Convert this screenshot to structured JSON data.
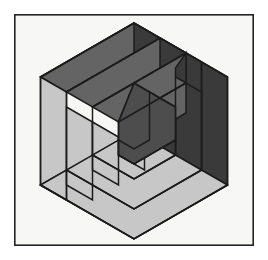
{
  "artwork": {
    "title": "Hexagonal Spiral Op-Art Figure",
    "type": "geometric-illustration",
    "canvas": {
      "width": 268,
      "height": 260,
      "background": "#ffffff"
    },
    "frame": {
      "x": 14,
      "y": 14,
      "width": 240,
      "height": 232,
      "fill": "#f7f7f5",
      "stroke": "#232323",
      "stroke_width": 1.6
    },
    "palette": {
      "light_face": "#c7c7c7",
      "medium_face": "#646464",
      "dark_face": "#3a3a3a",
      "outline": "#1c1c1c",
      "paper": "#f7f7f5",
      "page": "#ffffff"
    },
    "hexagon": {
      "center_x": 134,
      "center_y": 131,
      "radius": 108,
      "orientation": "pointy-top-bottom",
      "vertices": [
        {
          "name": "top",
          "x": 134,
          "y": 23
        },
        {
          "name": "upper-right",
          "x": 227.5,
          "y": 77
        },
        {
          "name": "lower-right",
          "x": 227.5,
          "y": 185
        },
        {
          "name": "bottom",
          "x": 134,
          "y": 239
        },
        {
          "name": "lower-left",
          "x": 40.5,
          "y": 185
        },
        {
          "name": "upper-left",
          "x": 40.5,
          "y": 77
        }
      ]
    },
    "spiral": {
      "turns": 4,
      "band_width": 26,
      "description": "Three interlocking isometric arms spiralling inward; each arm occupies one 120-degree sector of the hexagon and is shaded as one cube face.",
      "arms": [
        {
          "name": "left-arm",
          "face": "light",
          "fill": "#c7c7c7"
        },
        {
          "name": "top-arm",
          "face": "medium",
          "fill": "#646464"
        },
        {
          "name": "right-arm",
          "face": "dark",
          "fill": "#3a3a3a"
        }
      ],
      "rings": [
        {
          "index": 0,
          "label": "outer-ring"
        },
        {
          "index": 1,
          "label": "second-ring"
        },
        {
          "index": 2,
          "label": "third-ring"
        },
        {
          "index": 3,
          "label": "inner-ring"
        },
        {
          "index": 4,
          "label": "core-hexagon",
          "fill": "#4d4d4d"
        }
      ]
    }
  }
}
